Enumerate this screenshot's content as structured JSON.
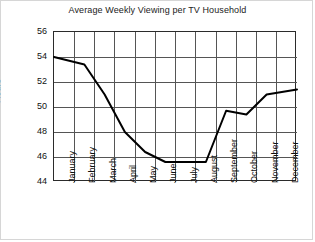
{
  "chart_data": {
    "type": "line",
    "title": "Average Weekly Viewing per TV Household",
    "xlabel": "",
    "ylabel": "Hours",
    "categories": [
      "January",
      "February",
      "March",
      "April",
      "May",
      "June",
      "July",
      "August",
      "September",
      "October",
      "November",
      "December"
    ],
    "values": [
      54.0,
      53.4,
      51.0,
      48.0,
      46.4,
      45.6,
      45.6,
      45.6,
      49.7,
      49.4,
      51.0,
      51.4
    ],
    "series": [
      {
        "name": "Average Weekly Viewing",
        "values": [
          54.0,
          53.4,
          51.0,
          48.0,
          46.4,
          45.6,
          45.6,
          45.6,
          49.7,
          49.4,
          51.0,
          51.4
        ]
      }
    ],
    "ylim": [
      44,
      56
    ],
    "ytick_labels": [
      "56",
      "54",
      "52",
      "50",
      "48",
      "46",
      "44"
    ],
    "ytick_values": [
      56,
      54,
      52,
      50,
      48,
      46,
      44
    ],
    "grid": true,
    "legend": "none",
    "line_color": "#000000",
    "grid_color": "#555555",
    "axis_color": "#2b2b2b",
    "background": "#ffffff"
  }
}
